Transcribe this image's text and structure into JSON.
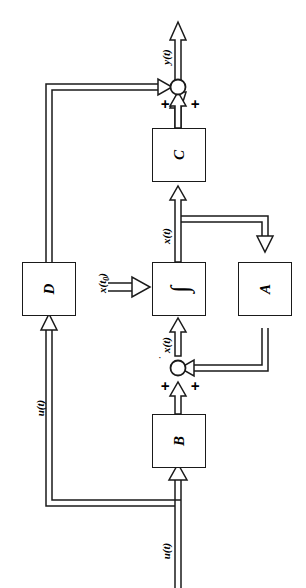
{
  "figure": {
    "kind": "state-space-block-diagram",
    "orientation": "rotated-90-ccw",
    "background_color": "#ffffff",
    "line_color": "#1a1a1a"
  },
  "blocks": [
    {
      "id": "C",
      "label": "C",
      "name": "block-c"
    },
    {
      "id": "D",
      "label": "D",
      "name": "block-d"
    },
    {
      "id": "INT",
      "label": "∫",
      "name": "block-integrator"
    },
    {
      "id": "A",
      "label": "A",
      "name": "block-a"
    },
    {
      "id": "B",
      "label": "B",
      "name": "block-b"
    }
  ],
  "signals": {
    "output": "y(t)",
    "state": "x(t)",
    "state_dot": "x(t)",
    "initial": "x(t",
    "initial_sub": "0",
    "initial_close": ")",
    "input_feed": "u(t)",
    "input": "u(t)"
  },
  "summing_junctions": [
    {
      "id": "sum-output",
      "name": "summing-junction-output",
      "signs": [
        "+",
        "+"
      ]
    },
    {
      "id": "sum-state",
      "name": "summing-junction-state",
      "signs": [
        "+",
        "+"
      ]
    }
  ],
  "signs": {
    "plus": "+"
  }
}
